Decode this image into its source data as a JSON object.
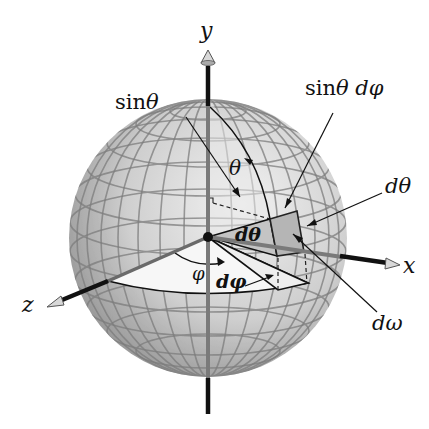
{
  "figure": {
    "colors": {
      "background": "#ffffff",
      "sphere_light": "#e6e6e6",
      "sphere_dark": "#8c8c8c",
      "grid": "#7a7a7a",
      "axis": "#111111",
      "patch": "#b8b8b8",
      "wedge": "#f4f4f4"
    }
  },
  "axes": {
    "y": {
      "label": "y"
    },
    "x": {
      "label": "x"
    },
    "z": {
      "label": "z"
    }
  },
  "labels": {
    "sin_theta": {
      "fn": "sin",
      "sym": "θ"
    },
    "theta": "θ",
    "sin_theta_dphi": {
      "fn": "sin",
      "sym": "θ dφ"
    },
    "dtheta_outer": "dθ",
    "dtheta_inner": "dθ",
    "phi": "φ",
    "dphi": "dφ",
    "domega": "dω"
  }
}
